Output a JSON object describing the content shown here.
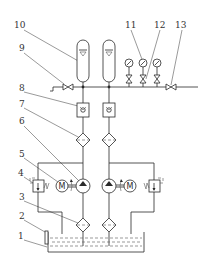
{
  "diagram": {
    "type": "hydraulic-schematic",
    "colors": {
      "line": "#2a2a2a",
      "background": "#ffffff"
    },
    "labels": [
      {
        "id": "1",
        "text": "1",
        "x": 18,
        "y": 239
      },
      {
        "id": "2",
        "text": "2",
        "x": 19,
        "y": 219
      },
      {
        "id": "3",
        "text": "3",
        "x": 19,
        "y": 200
      },
      {
        "id": "4",
        "text": "4",
        "x": 18,
        "y": 176
      },
      {
        "id": "5",
        "text": "5",
        "x": 19,
        "y": 157
      },
      {
        "id": "6",
        "text": "6",
        "x": 19,
        "y": 124
      },
      {
        "id": "7",
        "text": "7",
        "x": 19,
        "y": 107
      },
      {
        "id": "8",
        "text": "8",
        "x": 19,
        "y": 91
      },
      {
        "id": "9",
        "text": "9",
        "x": 19,
        "y": 51
      },
      {
        "id": "10",
        "text": "10",
        "x": 14,
        "y": 28
      },
      {
        "id": "11",
        "text": "11",
        "x": 125,
        "y": 28
      },
      {
        "id": "12",
        "text": "12",
        "x": 154,
        "y": 28
      },
      {
        "id": "13",
        "text": "13",
        "x": 175,
        "y": 28
      }
    ],
    "components": {
      "tank": "oil-tank",
      "level_gauge": "liquid-level-gauge",
      "return_filters": "suction-filter",
      "relief_valves": "relief-valve",
      "motors": "electric-motor",
      "pumps": "hydraulic-pump",
      "pressure_filters": "pressure-filter",
      "check_valves": "check-valve",
      "drain_valve": "stop-valve",
      "accumulators": "accumulator",
      "gauges": "pressure-gauge",
      "gauge_valves": "gauge-valve",
      "outlet_valve": "outlet-valve"
    },
    "motor_symbol": "M"
  }
}
